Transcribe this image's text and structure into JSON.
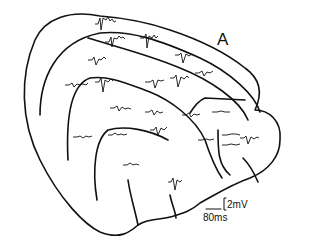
{
  "figure": {
    "panel_label": "A",
    "scale_bar_voltage": "2mV",
    "scale_bar_time": "80ms"
  }
}
